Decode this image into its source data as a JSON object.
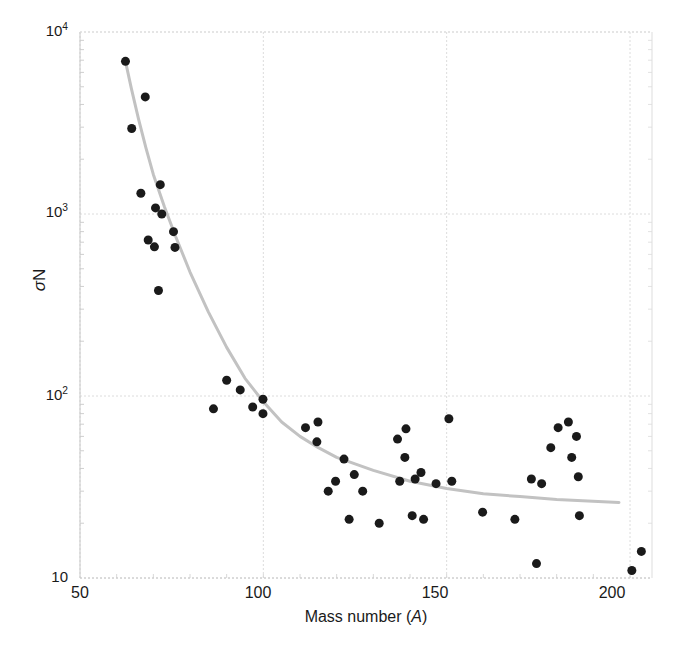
{
  "chart_data": {
    "type": "scatter",
    "title": "",
    "xlabel": "Mass number (A)",
    "xlabel_plain": "Mass number (A)",
    "ylabel": "sigma N",
    "ylabel_plain": "σN",
    "xscale": "linear",
    "yscale": "log",
    "xlim": [
      50,
      206
    ],
    "ylim": [
      10,
      10000
    ],
    "xticks": [
      50,
      100,
      150,
      200
    ],
    "xtick_labels": [
      "50",
      "100",
      "150",
      "200"
    ],
    "yticks": [
      10,
      100,
      1000,
      10000
    ],
    "ytick_labels": [
      "10",
      "10²",
      "10³",
      "10⁴"
    ],
    "grid": true,
    "grid_color": "#dcdcdc",
    "legend": "none",
    "marker_color": "#1a1a1a",
    "marker_size": 9,
    "fit_curve_color": "#c2c2c2",
    "fit_curve_width": 3,
    "series": [
      {
        "name": "sigma N data",
        "marker": "circle",
        "points": [
          {
            "x": 62.4,
            "y": 6900
          },
          {
            "x": 67.8,
            "y": 4400
          },
          {
            "x": 64.1,
            "y": 2950
          },
          {
            "x": 66.6,
            "y": 1300
          },
          {
            "x": 71.9,
            "y": 1450
          },
          {
            "x": 70.6,
            "y": 1080
          },
          {
            "x": 72.3,
            "y": 1000
          },
          {
            "x": 68.6,
            "y": 720
          },
          {
            "x": 75.5,
            "y": 800
          },
          {
            "x": 70.3,
            "y": 660
          },
          {
            "x": 75.9,
            "y": 655
          },
          {
            "x": 71.4,
            "y": 380
          },
          {
            "x": 90.0,
            "y": 122
          },
          {
            "x": 93.7,
            "y": 108
          },
          {
            "x": 86.4,
            "y": 85
          },
          {
            "x": 97.1,
            "y": 87
          },
          {
            "x": 99.9,
            "y": 96
          },
          {
            "x": 99.9,
            "y": 80
          },
          {
            "x": 111.5,
            "y": 67
          },
          {
            "x": 114.9,
            "y": 72
          },
          {
            "x": 114.6,
            "y": 56
          },
          {
            "x": 122.0,
            "y": 45
          },
          {
            "x": 119.7,
            "y": 34
          },
          {
            "x": 117.7,
            "y": 30
          },
          {
            "x": 124.8,
            "y": 37
          },
          {
            "x": 127.1,
            "y": 30
          },
          {
            "x": 123.4,
            "y": 21
          },
          {
            "x": 131.6,
            "y": 20
          },
          {
            "x": 136.6,
            "y": 58
          },
          {
            "x": 138.9,
            "y": 66
          },
          {
            "x": 138.6,
            "y": 46
          },
          {
            "x": 143.0,
            "y": 38
          },
          {
            "x": 137.2,
            "y": 34
          },
          {
            "x": 141.4,
            "y": 35
          },
          {
            "x": 140.6,
            "y": 22
          },
          {
            "x": 143.7,
            "y": 21
          },
          {
            "x": 147.1,
            "y": 33
          },
          {
            "x": 150.6,
            "y": 75
          },
          {
            "x": 151.4,
            "y": 34
          },
          {
            "x": 159.8,
            "y": 23
          },
          {
            "x": 168.6,
            "y": 21
          },
          {
            "x": 173.1,
            "y": 35
          },
          {
            "x": 175.9,
            "y": 33
          },
          {
            "x": 174.5,
            "y": 12
          },
          {
            "x": 180.4,
            "y": 67
          },
          {
            "x": 185.4,
            "y": 60
          },
          {
            "x": 178.4,
            "y": 52
          },
          {
            "x": 183.2,
            "y": 72
          },
          {
            "x": 184.1,
            "y": 46
          },
          {
            "x": 185.9,
            "y": 36
          },
          {
            "x": 186.2,
            "y": 22
          },
          {
            "x": 203.1,
            "y": 14
          },
          {
            "x": 200.5,
            "y": 11
          }
        ]
      }
    ],
    "fit_curve": {
      "name": "trend",
      "points": [
        {
          "x": 62.4,
          "y": 6900
        },
        {
          "x": 64.0,
          "y": 4900
        },
        {
          "x": 66.0,
          "y": 3300
        },
        {
          "x": 68.0,
          "y": 2300
        },
        {
          "x": 70.0,
          "y": 1650
        },
        {
          "x": 73.0,
          "y": 1100
        },
        {
          "x": 76.0,
          "y": 760
        },
        {
          "x": 80.0,
          "y": 480
        },
        {
          "x": 85.0,
          "y": 290
        },
        {
          "x": 90.0,
          "y": 185
        },
        {
          "x": 95.0,
          "y": 125
        },
        {
          "x": 100.0,
          "y": 93
        },
        {
          "x": 105.0,
          "y": 72
        },
        {
          "x": 110.0,
          "y": 60
        },
        {
          "x": 115.0,
          "y": 52
        },
        {
          "x": 120.0,
          "y": 46
        },
        {
          "x": 130.0,
          "y": 39
        },
        {
          "x": 140.0,
          "y": 34
        },
        {
          "x": 150.0,
          "y": 31
        },
        {
          "x": 160.0,
          "y": 29
        },
        {
          "x": 170.0,
          "y": 28
        },
        {
          "x": 180.0,
          "y": 27
        },
        {
          "x": 197.0,
          "y": 26
        }
      ]
    }
  },
  "axes": {
    "y_title_prefix": "σ",
    "y_title_suffix": "N",
    "x_title_prefix": "Mass number (",
    "x_title_italic": "A",
    "x_title_suffix": ")",
    "ytick_10": "10",
    "ytick_100_base": "10",
    "ytick_100_exp": "2",
    "ytick_1000_base": "10",
    "ytick_1000_exp": "3",
    "ytick_10000_base": "10",
    "ytick_10000_exp": "4",
    "xtick_50": "50",
    "xtick_100": "100",
    "xtick_150": "150",
    "xtick_200": "200"
  }
}
